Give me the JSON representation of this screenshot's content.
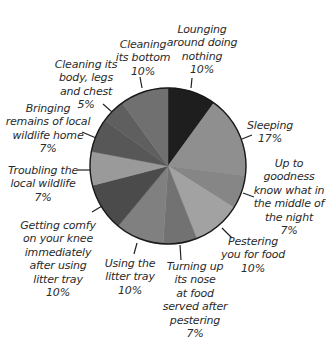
{
  "chart_data": {
    "type": "pie",
    "title": "",
    "start_angle_deg": 0,
    "direction": "clockwise",
    "center": [
      168,
      166
    ],
    "radius": 78,
    "outline_color": "#1a1a1a",
    "slices": [
      {
        "label": "Lounging around doing nothing",
        "value": 10,
        "color": "#1e1e1e",
        "lines": [
          "Lounging",
          "around doing",
          "nothing",
          "10%"
        ],
        "label_pos": [
          202,
          23
        ],
        "leader": [
          [
            192,
            78
          ],
          [
            191,
            88
          ]
        ]
      },
      {
        "label": "Sleeping",
        "value": 17,
        "color": "#8f8f8f",
        "lines": [
          "Sleeping",
          "17%"
        ],
        "label_pos": [
          270,
          119
        ],
        "leader": [
          [
            252,
            135
          ],
          [
            242,
            139
          ]
        ]
      },
      {
        "label": "Up to goodness know what in the middle of the night",
        "value": 7,
        "color": "#868686",
        "lines": [
          "Up to",
          "goodness",
          "know what in",
          "the middle of",
          "the night",
          "7%"
        ],
        "label_pos": [
          289,
          157
        ],
        "leader": [
          [
            254,
            197
          ],
          [
            243,
            193
          ]
        ]
      },
      {
        "label": "Pestering you for food",
        "value": 10,
        "color": "#a2a2a2",
        "lines": [
          "Pestering",
          "you for food",
          "10%"
        ],
        "label_pos": [
          253,
          235
        ],
        "leader": [
          [
            232,
            238
          ],
          [
            222,
            228
          ]
        ]
      },
      {
        "label": "Turning up its nose at food served after pestering",
        "value": 7,
        "color": "#727272",
        "lines": [
          "Turning up",
          "its nose",
          "at food",
          "served after",
          "pestering",
          "7%"
        ],
        "label_pos": [
          195,
          260
        ],
        "leader": [
          [
            181,
            260
          ],
          [
            180,
            245
          ]
        ]
      },
      {
        "label": "Using the litter tray",
        "value": 10,
        "color": "#808080",
        "lines": [
          "Using the",
          "litter tray",
          "10%"
        ],
        "label_pos": [
          130,
          257
        ],
        "leader": [
          [
            134,
            254
          ],
          [
            137,
            243
          ]
        ]
      },
      {
        "label": "Getting comfy on your knee immediately after using litter tray",
        "value": 10,
        "color": "#4b4b4b",
        "lines": [
          "Getting comfy",
          "on your knee",
          "immediately",
          "after using",
          "litter tray",
          "10%"
        ],
        "label_pos": [
          58,
          219
        ],
        "leader": [
          [
            92,
            212
          ],
          [
            102,
            206
          ]
        ]
      },
      {
        "label": "Troubling the local wildlife",
        "value": 7,
        "color": "#9a9a9a",
        "lines": [
          "Troubling the",
          "local wildlife",
          "7%"
        ],
        "label_pos": [
          43,
          164
        ],
        "leader": [
          [
            78,
            170
          ],
          [
            91,
            170
          ]
        ]
      },
      {
        "label": "Bringing remains of local wildlife home",
        "value": 7,
        "color": "#575757",
        "lines": [
          "Bringing",
          "remains of local",
          "wildlife home",
          "7%"
        ],
        "label_pos": [
          48,
          102
        ],
        "leader": [
          [
            82,
            132
          ],
          [
            96,
            138
          ]
        ]
      },
      {
        "label": "Cleaning its body, legs and chest",
        "value": 5,
        "color": "#5f5f5f",
        "lines": [
          "Cleaning its",
          "body, legs",
          "and chest",
          "5%"
        ],
        "label_pos": [
          86,
          58
        ],
        "leader": [
          [
            103,
            104
          ],
          [
            112,
            112
          ]
        ]
      },
      {
        "label": "Cleaning its bottom",
        "value": 10,
        "color": "#707070",
        "lines": [
          "Cleaning",
          "its bottom",
          "10%"
        ],
        "label_pos": [
          143,
          38
        ],
        "leader": [
          [
            140,
            77
          ],
          [
            142,
            88
          ]
        ]
      }
    ]
  }
}
